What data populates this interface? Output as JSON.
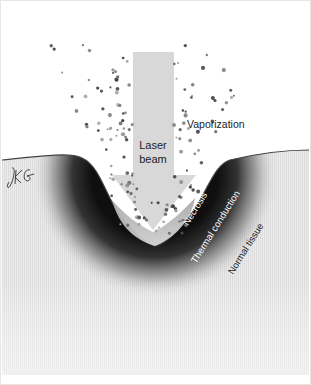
{
  "diagram": {
    "labels": {
      "laser_line1": "Laser",
      "laser_line2": "beam",
      "vaporization": "Vaporization",
      "necrosis": "Necrosis",
      "thermal": "Thermal conduction",
      "normal": "Normal tissue"
    },
    "signature": "JKG",
    "colors": {
      "background": "#ffffff",
      "beam": "#d6d6d6",
      "tissue_light": "#e9e9e9",
      "necrosis_dark": "#111111",
      "particle": "#6a6a6a",
      "surface_line": "#444444"
    }
  }
}
